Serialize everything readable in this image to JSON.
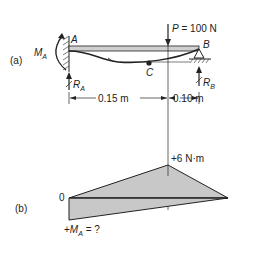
{
  "figure": {
    "part_a": {
      "label": "(a)",
      "load": {
        "symbol": "P",
        "equals": "=",
        "value": "100 N"
      },
      "support_a": {
        "point": "A",
        "moment_symbol": "M",
        "moment_sub": "A",
        "reaction_symbol": "R",
        "reaction_sub": "A"
      },
      "support_b": {
        "point": "B",
        "reaction_symbol": "R",
        "reaction_sub": "B"
      },
      "point_c": "C",
      "dimensions": [
        {
          "label": "0.15 m"
        },
        {
          "label": "0.10 m"
        }
      ]
    },
    "part_b": {
      "label": "(b)",
      "peak_label": "+6 N·m",
      "zero_label": "0",
      "moment_query": {
        "prefix": "+",
        "symbol": "M",
        "sub": "A",
        "suffix": " = ?"
      }
    },
    "colors": {
      "line": "#222222",
      "fill": "#c8c8c8",
      "beam": "#d0d0d0"
    }
  }
}
